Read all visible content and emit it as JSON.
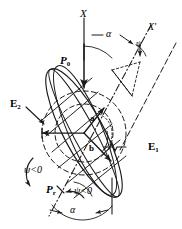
{
  "figure": {
    "type": "vector-geometry-diagram",
    "stroke_color": "#1a1a1a",
    "background_color": "#ffffff"
  },
  "axes": {
    "x_label": "X",
    "x_prime_label": "X'",
    "vertical_axis_note": "solid vertical reference line through centre",
    "prime_axis_note": "dash-dot inclined axis"
  },
  "vectors": {
    "p0_label": "P",
    "p0_sub": "0",
    "pr_label": "P",
    "pr_sub": "r"
  },
  "circles": {
    "outer_label": "E",
    "outer_sub": "2",
    "inner_label": "E",
    "inner_sub": "1"
  },
  "semi_axes": {
    "major_label": "a",
    "minor_label": "b"
  },
  "angles": {
    "alpha_top": "α",
    "alpha_bottom": "α",
    "psi_top": "ψ",
    "psi_left": "ψ<0",
    "psi_bottom": "ψ<0"
  }
}
